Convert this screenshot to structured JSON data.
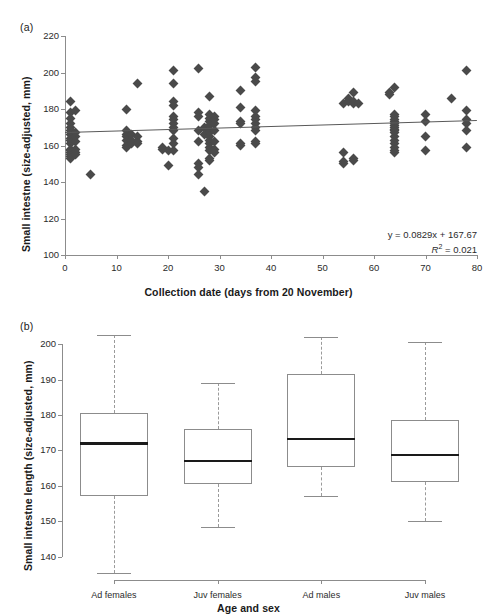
{
  "figure": {
    "panel_a_label": "(a)",
    "panel_b_label": "(b)"
  },
  "chart_data": [
    {
      "id": "panel-a",
      "type": "scatter",
      "title": "",
      "xlabel": "Collection date (days from 20 November)",
      "ylabel": "Small intestne (size-adjusted, mm)",
      "xlim": [
        0,
        80
      ],
      "ylim": [
        100,
        220
      ],
      "xticks": [
        0,
        10,
        20,
        30,
        40,
        50,
        60,
        70,
        80
      ],
      "yticks": [
        100,
        120,
        140,
        160,
        180,
        200,
        220
      ],
      "grid": false,
      "legend": "none",
      "marker": "diamond",
      "marker_color": "#4a4a4a",
      "trendline": {
        "color": "#595959",
        "slope": 0.0829,
        "intercept": 167.67,
        "equation_text": "y = 0.0829x + 167.67",
        "r2_text": "R",
        "r2_exponent": "2",
        "r2_value": " = 0.021"
      },
      "points": [
        [
          1,
          184
        ],
        [
          1,
          178
        ],
        [
          1,
          175
        ],
        [
          1,
          172
        ],
        [
          1,
          170
        ],
        [
          1,
          168
        ],
        [
          1,
          166
        ],
        [
          1,
          164
        ],
        [
          1,
          163
        ],
        [
          1,
          161
        ],
        [
          1,
          158
        ],
        [
          1,
          157
        ],
        [
          1,
          156
        ],
        [
          1,
          155
        ],
        [
          1,
          154
        ],
        [
          1,
          153
        ],
        [
          2,
          179
        ],
        [
          2,
          167
        ],
        [
          2,
          165
        ],
        [
          2,
          162
        ],
        [
          2,
          158
        ],
        [
          2,
          156
        ],
        [
          2,
          155
        ],
        [
          5,
          144
        ],
        [
          12,
          180
        ],
        [
          12,
          168
        ],
        [
          12,
          166
        ],
        [
          12,
          165
        ],
        [
          12,
          163
        ],
        [
          12,
          160
        ],
        [
          12,
          159
        ],
        [
          13,
          166
        ],
        [
          13,
          163
        ],
        [
          13,
          161
        ],
        [
          14,
          194
        ],
        [
          14,
          165
        ],
        [
          14,
          162
        ],
        [
          14,
          161
        ],
        [
          19,
          159
        ],
        [
          19,
          158
        ],
        [
          20,
          157
        ],
        [
          20,
          149
        ],
        [
          21,
          201
        ],
        [
          21,
          194
        ],
        [
          21,
          184
        ],
        [
          21,
          182
        ],
        [
          21,
          176
        ],
        [
          21,
          174
        ],
        [
          21,
          172
        ],
        [
          21,
          170
        ],
        [
          21,
          168
        ],
        [
          21,
          164
        ],
        [
          21,
          161
        ],
        [
          21,
          157
        ],
        [
          26,
          202
        ],
        [
          26,
          178
        ],
        [
          26,
          176
        ],
        [
          26,
          168
        ],
        [
          26,
          162
        ],
        [
          26,
          150
        ],
        [
          26,
          148
        ],
        [
          26,
          144
        ],
        [
          27,
          135
        ],
        [
          27,
          170
        ],
        [
          27,
          166
        ],
        [
          28,
          187
        ],
        [
          28,
          177
        ],
        [
          28,
          175
        ],
        [
          28,
          173
        ],
        [
          28,
          171
        ],
        [
          28,
          169
        ],
        [
          28,
          167
        ],
        [
          28,
          165
        ],
        [
          28,
          163
        ],
        [
          28,
          161
        ],
        [
          28,
          159
        ],
        [
          28,
          157
        ],
        [
          28,
          153
        ],
        [
          28,
          152
        ],
        [
          29,
          176
        ],
        [
          29,
          174
        ],
        [
          29,
          172
        ],
        [
          29,
          168
        ],
        [
          29,
          162
        ],
        [
          29,
          158
        ],
        [
          29,
          156
        ],
        [
          34,
          190
        ],
        [
          34,
          181
        ],
        [
          34,
          173
        ],
        [
          34,
          172
        ],
        [
          34,
          161
        ],
        [
          34,
          160
        ],
        [
          37,
          203
        ],
        [
          37,
          197
        ],
        [
          37,
          195
        ],
        [
          37,
          179
        ],
        [
          37,
          176
        ],
        [
          37,
          174
        ],
        [
          37,
          172
        ],
        [
          37,
          170
        ],
        [
          37,
          168
        ],
        [
          37,
          162
        ],
        [
          37,
          161
        ],
        [
          54,
          183
        ],
        [
          54,
          156
        ],
        [
          54,
          151
        ],
        [
          54,
          150
        ],
        [
          55,
          184
        ],
        [
          55,
          186
        ],
        [
          56,
          189
        ],
        [
          56,
          184
        ],
        [
          56,
          183
        ],
        [
          56,
          153
        ],
        [
          56,
          152
        ],
        [
          57,
          183
        ],
        [
          63,
          188
        ],
        [
          63,
          189
        ],
        [
          64,
          192
        ],
        [
          64,
          177
        ],
        [
          64,
          176
        ],
        [
          64,
          174
        ],
        [
          64,
          173
        ],
        [
          64,
          172
        ],
        [
          64,
          171
        ],
        [
          64,
          170
        ],
        [
          64,
          169
        ],
        [
          64,
          168
        ],
        [
          64,
          167
        ],
        [
          64,
          165
        ],
        [
          64,
          163
        ],
        [
          64,
          161
        ],
        [
          64,
          159
        ],
        [
          64,
          157
        ],
        [
          64,
          156
        ],
        [
          70,
          177
        ],
        [
          70,
          173
        ],
        [
          70,
          165
        ],
        [
          70,
          157
        ],
        [
          75,
          186
        ],
        [
          78,
          201
        ],
        [
          78,
          179
        ],
        [
          78,
          174
        ],
        [
          78,
          172
        ],
        [
          78,
          168
        ],
        [
          78,
          159
        ]
      ]
    },
    {
      "id": "panel-b",
      "type": "box",
      "title": "",
      "xlabel": "Age and sex",
      "ylabel": "Small intestne length (size-adjusted, mm)",
      "ylim": [
        134,
        204
      ],
      "yticks": [
        140,
        150,
        160,
        170,
        180,
        190,
        200
      ],
      "grid": false,
      "legend": "none",
      "categories": [
        "Ad females",
        "Juv females",
        "Ad males",
        "Juv males"
      ],
      "boxes": [
        {
          "label": "Ad females",
          "whisker_low": 135.4,
          "q1": 157.2,
          "median": 172.0,
          "q3": 180.5,
          "whisker_high": 202.5
        },
        {
          "label": "Juv females",
          "whisker_low": 148.5,
          "q1": 160.4,
          "median": 167.0,
          "q3": 176.0,
          "whisker_high": 189.1
        },
        {
          "label": "Ad males",
          "whisker_low": 157.2,
          "q1": 165.4,
          "median": 173.3,
          "q3": 191.7,
          "whisker_high": 202.1
        },
        {
          "label": "Juv males",
          "whisker_low": 150.2,
          "q1": 161.2,
          "median": 168.8,
          "q3": 178.5,
          "whisker_high": 200.7
        }
      ]
    }
  ]
}
